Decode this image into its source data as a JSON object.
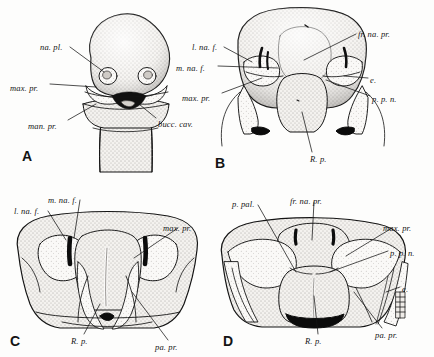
{
  "figure": {
    "type": "scientific-illustration",
    "background_color": "#fdfdfc",
    "ink_color": "#141414",
    "panel_letters": [
      "A",
      "B",
      "C",
      "D"
    ]
  },
  "abbreviations": {
    "na_pl": "na. pl.",
    "max_pr": "max. pr.",
    "man_pr": "man. pr.",
    "bucc_cav": "bucc. cav.",
    "l_na_f": "l. na. f.",
    "m_na_f": "m. na. f.",
    "fr_na_pr": "fr. na. pr.",
    "e": "e.",
    "p_p_n": "p. p. n.",
    "R_p": "R. p.",
    "pa_pr": "pa. pr.",
    "p_pal": "p. pal."
  },
  "panels": [
    {
      "letter": "A",
      "letter_pos": {
        "x": 22,
        "y": 148
      },
      "labels": [
        {
          "key": "na_pl",
          "text": "na. pl.",
          "x": 40,
          "y": 43,
          "align": "left"
        },
        {
          "key": "max_pr",
          "text": "max. pr.",
          "x": 10,
          "y": 84,
          "align": "left"
        },
        {
          "key": "man_pr",
          "text": "man. pr.",
          "x": 28,
          "y": 122,
          "align": "left"
        },
        {
          "key": "bucc_cav",
          "text": "bucc. cav.",
          "x": 158,
          "y": 120,
          "align": "left"
        }
      ]
    },
    {
      "letter": "B",
      "letter_pos": {
        "x": 215,
        "y": 155
      },
      "labels": [
        {
          "key": "l_na_f",
          "text": "l. na. f.",
          "x": 192,
          "y": 43,
          "align": "left"
        },
        {
          "key": "m_na_f",
          "text": "m. na. f.",
          "x": 176,
          "y": 64,
          "align": "left"
        },
        {
          "key": "max_pr",
          "text": "max. pr.",
          "x": 182,
          "y": 94,
          "align": "left"
        },
        {
          "key": "fr_na_pr",
          "text": "fr. na. pr.",
          "x": 358,
          "y": 30,
          "align": "left"
        },
        {
          "key": "e",
          "text": "e.",
          "x": 370,
          "y": 76,
          "align": "left"
        },
        {
          "key": "p_p_n",
          "text": "p. p. n.",
          "x": 372,
          "y": 95,
          "align": "left"
        },
        {
          "key": "R_p",
          "text": "R. p.",
          "x": 310,
          "y": 155,
          "align": "left"
        }
      ]
    },
    {
      "letter": "C",
      "letter_pos": {
        "x": 10,
        "y": 333
      },
      "labels": [
        {
          "key": "m_na_f",
          "text": "m. na. f.",
          "x": 48,
          "y": 196,
          "align": "left"
        },
        {
          "key": "l_na_f",
          "text": "l. na. f.",
          "x": 14,
          "y": 207,
          "align": "left"
        },
        {
          "key": "max_pr",
          "text": "max. pr.",
          "x": 163,
          "y": 224,
          "align": "left"
        },
        {
          "key": "R_p",
          "text": "R. p.",
          "x": 71,
          "y": 337,
          "align": "left"
        },
        {
          "key": "pa_pr",
          "text": "pa. pr.",
          "x": 155,
          "y": 343,
          "align": "left"
        }
      ]
    },
    {
      "letter": "D",
      "letter_pos": {
        "x": 223,
        "y": 333
      },
      "labels": [
        {
          "key": "p_pal",
          "text": "p. pal.",
          "x": 232,
          "y": 200,
          "align": "left"
        },
        {
          "key": "fr_na_pr",
          "text": "fr. na. pr.",
          "x": 290,
          "y": 197,
          "align": "left"
        },
        {
          "key": "max_pr",
          "text": "max. pr.",
          "x": 383,
          "y": 224,
          "align": "left"
        },
        {
          "key": "p_p_n",
          "text": "p. p. n.",
          "x": 390,
          "y": 249,
          "align": "left"
        },
        {
          "key": "e",
          "text": "e.",
          "x": 402,
          "y": 285,
          "align": "left"
        },
        {
          "key": "R_p",
          "text": "R. p.",
          "x": 305,
          "y": 337,
          "align": "left"
        },
        {
          "key": "pa_pr",
          "text": "pa. pr.",
          "x": 375,
          "y": 331,
          "align": "left"
        }
      ]
    }
  ]
}
